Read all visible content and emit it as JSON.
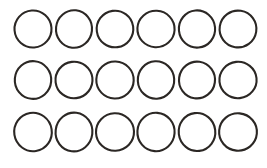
{
  "canvas": {
    "width": 267,
    "height": 168,
    "background_color": "#ffffff",
    "description": "grid-of-hand-drawn-circles"
  },
  "style": {
    "stroke_color": "#2b2724",
    "stroke_width": 2.1,
    "fill": "none"
  },
  "grid": {
    "rows": 3,
    "columns": 6,
    "total_circles": 18,
    "column_pitch": 41,
    "row_pitch": 51
  },
  "shapes": [
    {
      "id": "circle-r1-c1",
      "row": 1,
      "col": 1,
      "cx": 33,
      "cy": 29,
      "rx": 18.5,
      "ry": 18.5,
      "rotate": -4
    },
    {
      "id": "circle-r1-c2",
      "row": 1,
      "col": 2,
      "cx": 74,
      "cy": 29,
      "rx": 18.0,
      "ry": 18.8,
      "rotate": 6
    },
    {
      "id": "circle-r1-c3",
      "row": 1,
      "col": 3,
      "cx": 115,
      "cy": 29,
      "rx": 18.3,
      "ry": 18.3,
      "rotate": -8
    },
    {
      "id": "circle-r1-c4",
      "row": 1,
      "col": 4,
      "cx": 156,
      "cy": 29,
      "rx": 18.6,
      "ry": 18.2,
      "rotate": 3
    },
    {
      "id": "circle-r1-c5",
      "row": 1,
      "col": 5,
      "cx": 197,
      "cy": 29,
      "rx": 18.1,
      "ry": 18.6,
      "rotate": -5
    },
    {
      "id": "circle-r1-c6",
      "row": 1,
      "col": 6,
      "cx": 238,
      "cy": 29,
      "rx": 18.4,
      "ry": 18.4,
      "rotate": 9
    },
    {
      "id": "circle-r2-c1",
      "row": 2,
      "col": 1,
      "cx": 33,
      "cy": 80,
      "rx": 18.2,
      "ry": 18.9,
      "rotate": 5
    },
    {
      "id": "circle-r2-c2",
      "row": 2,
      "col": 2,
      "cx": 74,
      "cy": 80,
      "rx": 18.5,
      "ry": 18.3,
      "rotate": -7
    },
    {
      "id": "circle-r2-c3",
      "row": 2,
      "col": 3,
      "cx": 115,
      "cy": 80,
      "rx": 18.7,
      "ry": 18.5,
      "rotate": 2
    },
    {
      "id": "circle-r2-c4",
      "row": 2,
      "col": 4,
      "cx": 156,
      "cy": 80,
      "rx": 18.2,
      "ry": 18.7,
      "rotate": -3
    },
    {
      "id": "circle-r2-c5",
      "row": 2,
      "col": 5,
      "cx": 197,
      "cy": 80,
      "rx": 18.0,
      "ry": 18.4,
      "rotate": 8
    },
    {
      "id": "circle-r2-c6",
      "row": 2,
      "col": 6,
      "cx": 238,
      "cy": 80,
      "rx": 18.6,
      "ry": 18.2,
      "rotate": -6
    },
    {
      "id": "circle-r3-c1",
      "row": 3,
      "col": 1,
      "cx": 33,
      "cy": 132,
      "rx": 18.8,
      "ry": 19.2,
      "rotate": -9
    },
    {
      "id": "circle-r3-c2",
      "row": 3,
      "col": 2,
      "cx": 74,
      "cy": 132,
      "rx": 18.4,
      "ry": 19.4,
      "rotate": 7
    },
    {
      "id": "circle-r3-c3",
      "row": 3,
      "col": 3,
      "cx": 115,
      "cy": 132,
      "rx": 19.0,
      "ry": 18.8,
      "rotate": -2
    },
    {
      "id": "circle-r3-c4",
      "row": 3,
      "col": 4,
      "cx": 156,
      "cy": 132,
      "rx": 18.6,
      "ry": 19.2,
      "rotate": 4
    },
    {
      "id": "circle-r3-c5",
      "row": 3,
      "col": 5,
      "cx": 197,
      "cy": 132,
      "rx": 18.3,
      "ry": 19.0,
      "rotate": -7
    },
    {
      "id": "circle-r3-c6",
      "row": 3,
      "col": 6,
      "cx": 238,
      "cy": 132,
      "rx": 18.9,
      "ry": 18.7,
      "rotate": 5
    }
  ]
}
